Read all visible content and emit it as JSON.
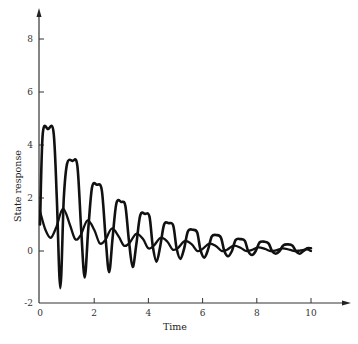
{
  "chart_data": {
    "type": "line",
    "title": "",
    "xlabel": "Time",
    "ylabel": "State response",
    "xlim": [
      0,
      10
    ],
    "ylim": [
      -2,
      9
    ],
    "grid": false,
    "legend": null,
    "xticks": [
      0,
      2,
      4,
      6,
      8,
      10
    ],
    "xtick_labels": [
      "0",
      "2",
      "4",
      "6",
      "8",
      "10"
    ],
    "yticks": [
      -2,
      0,
      2,
      4,
      6,
      8
    ],
    "ytick_labels": [
      "-2",
      "0",
      "2",
      "4",
      "6",
      "8"
    ],
    "series": [
      {
        "name": "state 1 (large oscillation, flat-topped peaks)",
        "x": [
          0,
          0.1,
          0.3,
          0.5,
          0.62,
          0.75,
          0.88,
          1.0,
          1.2,
          1.38,
          1.52,
          1.65,
          1.78,
          1.92,
          2.1,
          2.28,
          2.42,
          2.55,
          2.68,
          2.82,
          3.0,
          3.15,
          3.28,
          3.42,
          3.56,
          3.7,
          3.88,
          4.04,
          4.16,
          4.3,
          4.44,
          4.58,
          4.75,
          4.92,
          5.04,
          5.18,
          5.32,
          5.46,
          5.64,
          5.8,
          5.92,
          6.06,
          6.2,
          6.34,
          6.52,
          6.68,
          6.8,
          6.94,
          7.08,
          7.22,
          7.4,
          7.56,
          7.68,
          7.82,
          7.96,
          8.1,
          8.28,
          8.44,
          8.56,
          8.7,
          8.84,
          8.98,
          9.16,
          9.32,
          9.44,
          9.58,
          9.72,
          9.86,
          10.0
        ],
        "y": [
          1.0,
          4.4,
          4.6,
          4.5,
          2.0,
          -1.4,
          2.0,
          3.3,
          3.4,
          3.2,
          0.8,
          -1.0,
          0.8,
          2.4,
          2.5,
          2.3,
          0.5,
          -0.8,
          0.5,
          1.8,
          1.85,
          1.7,
          0.4,
          -0.6,
          0.3,
          1.35,
          1.4,
          1.3,
          0.2,
          -0.4,
          0.2,
          1.0,
          1.05,
          0.95,
          0.1,
          -0.3,
          0.1,
          0.75,
          0.8,
          0.7,
          0.05,
          -0.25,
          0.05,
          0.55,
          0.6,
          0.5,
          0.0,
          -0.2,
          0.0,
          0.42,
          0.45,
          0.38,
          0.0,
          -0.15,
          0.0,
          0.32,
          0.35,
          0.28,
          0.0,
          -0.1,
          0.0,
          0.22,
          0.25,
          0.2,
          0.0,
          -0.1,
          0.0,
          0.1,
          0.1
        ]
      },
      {
        "name": "state 2 (smaller oscillation)",
        "x": [
          0,
          0.2,
          0.4,
          0.6,
          0.85,
          1.1,
          1.3,
          1.5,
          1.75,
          2.0,
          2.2,
          2.4,
          2.65,
          2.9,
          3.1,
          3.3,
          3.55,
          3.8,
          4.0,
          4.2,
          4.45,
          4.7,
          4.9,
          5.1,
          5.35,
          5.6,
          5.8,
          6.0,
          6.25,
          6.5,
          6.7,
          6.9,
          7.15,
          7.4,
          7.6,
          7.8,
          8.05,
          8.3,
          8.5,
          8.7,
          8.95,
          9.2,
          9.4,
          9.6,
          9.85,
          10.0
        ],
        "y": [
          1.5,
          0.8,
          0.5,
          0.9,
          1.6,
          1.0,
          0.45,
          0.6,
          1.15,
          0.8,
          0.3,
          0.4,
          0.85,
          0.55,
          0.2,
          0.3,
          0.65,
          0.45,
          0.1,
          0.2,
          0.5,
          0.35,
          0.05,
          0.12,
          0.38,
          0.25,
          0.0,
          0.08,
          0.28,
          0.18,
          0.0,
          0.05,
          0.2,
          0.12,
          0.0,
          0.03,
          0.14,
          0.08,
          0.0,
          0.02,
          0.1,
          0.05,
          0.0,
          0.02,
          0.06,
          0.0
        ]
      }
    ]
  },
  "colors": {
    "line": "#111111",
    "axis": "#333333",
    "background": "#ffffff"
  }
}
